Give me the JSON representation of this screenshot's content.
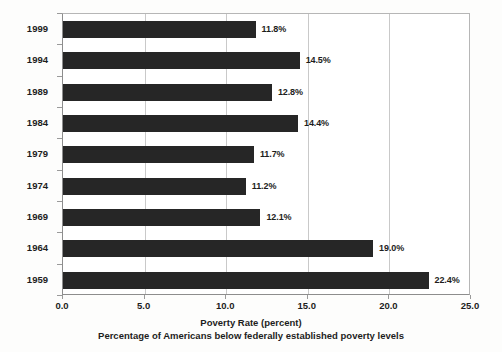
{
  "chart_data": {
    "type": "bar",
    "orientation": "horizontal",
    "title": "",
    "xlabel": "Poverty Rate (percent)",
    "sublabel": "Percentage of Americans below federally established poverty levels",
    "ylabel": "",
    "categories": [
      "1999",
      "1994",
      "1989",
      "1984",
      "1979",
      "1974",
      "1969",
      "1964",
      "1959"
    ],
    "values": [
      11.8,
      14.5,
      12.8,
      14.4,
      11.7,
      11.2,
      12.1,
      19.0,
      22.4
    ],
    "value_labels": [
      "11.8%",
      "14.5%",
      "12.8%",
      "14.4%",
      "11.7%",
      "11.2%",
      "12.1%",
      "19.0%",
      "22.4%"
    ],
    "xlim": [
      0.0,
      25.0
    ],
    "xticks": [
      0.0,
      5.0,
      10.0,
      15.0,
      20.0,
      25.0
    ],
    "xtick_labels": [
      "0.0",
      "5.0",
      "10.0",
      "15.0",
      "20.0",
      "25.0"
    ],
    "grid": "vertical",
    "legend": "none",
    "bar_color": "#262626",
    "grid_color": "#c9c9c9",
    "axis_color": "#8d8d8d",
    "text_color": "#1d1d1d",
    "background_color": "#ffffff"
  }
}
